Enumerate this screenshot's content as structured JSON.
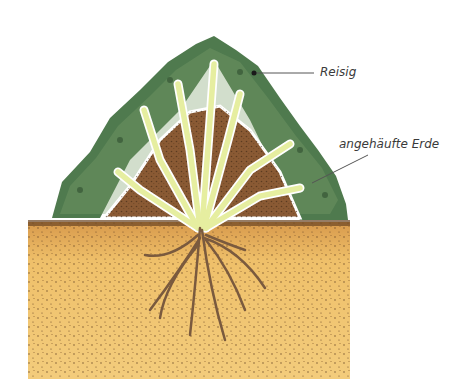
{
  "diagram": {
    "type": "illustration",
    "labels": [
      {
        "id": "reisig",
        "text": "Reisig"
      },
      {
        "id": "erde",
        "text": "angehäufte Erde"
      }
    ],
    "colors": {
      "soil": "#e9b961",
      "soil_dark": "#b88440",
      "mound": "#8a5a34",
      "brushwood": "#4f7a4e",
      "brushwood_light": "#7ea06e",
      "stems": "#e6eea0",
      "stem_outline": "#8a9a4a",
      "roots": "#7a5a3e",
      "leader_line": "#555555",
      "label_text": "#3a3a3a"
    }
  }
}
